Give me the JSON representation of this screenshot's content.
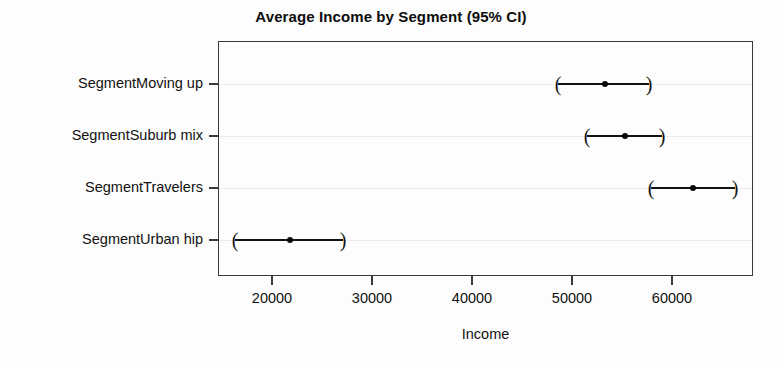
{
  "chart_data": {
    "type": "scatter",
    "title": "Average Income by Segment (95% CI)",
    "xlabel": "Income",
    "ylabel": "",
    "orientation": "horizontal",
    "grid": true,
    "legend": null,
    "xlim": [
      16300,
      69800
    ],
    "xticks": [
      20000,
      30000,
      40000,
      50000,
      60000
    ],
    "xticklabels": [
      "20000",
      "30000",
      "40000",
      "50000",
      "60000"
    ],
    "categories": [
      "SegmentMoving up",
      "SegmentSuburb mix",
      "SegmentTravelers",
      "SegmentUrban hip"
    ],
    "values": [
      53300,
      55300,
      62100,
      21800
    ],
    "ci_low": [
      48600,
      51500,
      57900,
      16300
    ],
    "ci_high": [
      57700,
      59000,
      66300,
      27100
    ],
    "points": [
      {
        "category": "SegmentMoving up",
        "estimate": 53300,
        "ci_low": 48600,
        "ci_high": 51500
      },
      {
        "category": "SegmentSuburb mix",
        "estimate": 55300,
        "ci_low": 51500,
        "ci_high": 59000
      },
      {
        "category": "SegmentTravelers",
        "estimate": 62100,
        "ci_low": 57900,
        "ci_high": 66300
      },
      {
        "category": "SegmentUrban hip",
        "estimate": 21800,
        "ci_low": 16300,
        "ci_high": 27100
      }
    ],
    "marker": "filled-circle",
    "ci_cap_glyph_left": "(",
    "ci_cap_glyph_right": ")",
    "colors": {
      "marker": "#0a0a0a",
      "line": "#141414",
      "frame": "#3a3a3a",
      "grid": "#ececec",
      "background": "#fdfdfd",
      "text": "#111111"
    }
  }
}
